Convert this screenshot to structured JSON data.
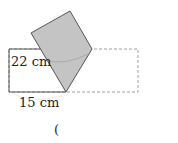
{
  "figure": {
    "labels": {
      "height": "22 cm",
      "width": "15 cm"
    },
    "answer_paren": "(",
    "colors": {
      "fill": "#c4c4c4",
      "stroke": "#555555",
      "dashed": "#888888"
    }
  }
}
